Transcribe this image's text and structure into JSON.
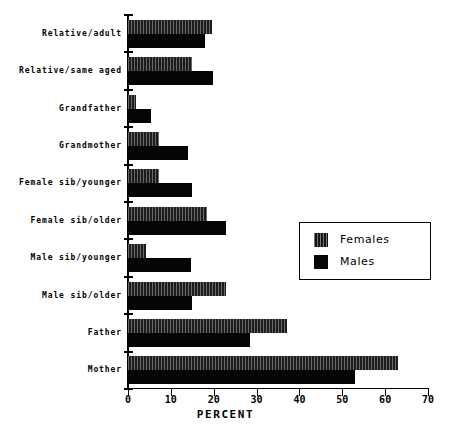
{
  "chart_data": {
    "type": "bar",
    "orientation": "horizontal",
    "title": "",
    "xlabel": "PERCENT",
    "ylabel": "",
    "xlim": [
      0,
      70
    ],
    "xticks": [
      0,
      10,
      20,
      30,
      40,
      50,
      60,
      70
    ],
    "xtick_labels": [
      "0",
      "10",
      "20",
      "30",
      "40",
      "50",
      "60",
      "70"
    ],
    "grid": false,
    "legend_position": "center-right",
    "categories": [
      "Relative/adult",
      "Relative/same aged",
      "Grandfather",
      "Grandmother",
      "Female sib/younger",
      "Female sib/older",
      "Male sib/younger",
      "Male sib/older",
      "Father",
      "Mother"
    ],
    "series": [
      {
        "name": "Females",
        "values": [
          19.5,
          15.0,
          1.8,
          7.3,
          7.3,
          18.5,
          4.3,
          22.8,
          37.0,
          63.0
        ]
      },
      {
        "name": "Males",
        "values": [
          18.0,
          19.8,
          5.3,
          14.0,
          15.0,
          22.8,
          14.7,
          15.0,
          28.5,
          53.0
        ]
      }
    ]
  },
  "legend": {
    "entries": [
      {
        "label": "Females",
        "swatch": "hatched-dark"
      },
      {
        "label": "Males",
        "swatch": "solid-black"
      }
    ]
  },
  "axis": {
    "x_title": "PERCENT"
  }
}
